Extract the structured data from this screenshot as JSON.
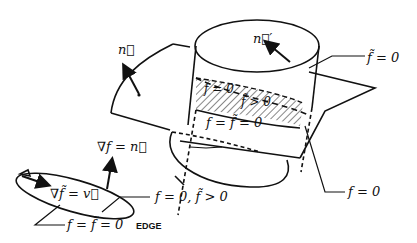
{
  "diagram": {
    "labels": {
      "n_vec": "n⃗",
      "n_prime": "n⃗′",
      "fbar_eq_0": "f̃ = 0",
      "f_eq_0_inside": "f = 0",
      "fbar_gt_0_inside": "f̃ > 0",
      "f_eq_fbar_eq_0_mid": "f = f̃ = 0",
      "f_eq_0_right": "f = 0",
      "grad_f_eq_n": "∇f = n⃗",
      "grad_fbar_eq_v": "∇f̃ = v⃗",
      "f_eq_0_fbar_gt_0": "f = 0, f̃ > 0",
      "f_eq_fbar_eq_0_bottom": "f = f̃ = 0",
      "edge": "EDGE"
    },
    "colors": {
      "stroke": "#111111",
      "background": "#ffffff"
    }
  }
}
